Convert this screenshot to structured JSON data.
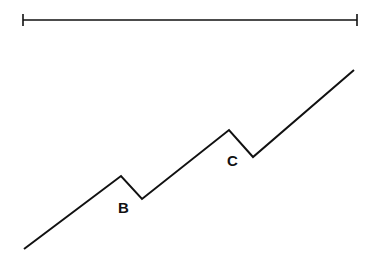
{
  "diagram": {
    "type": "zigzag-trend-line",
    "stroke_color": "#111111",
    "background": "#ffffff",
    "range_bar": {
      "x1": 23,
      "x2": 357,
      "y": 20,
      "cap_half_height": 6
    },
    "trend_points": [
      [
        24,
        249
      ],
      [
        121,
        176
      ],
      [
        142,
        199
      ],
      [
        229,
        130
      ],
      [
        253,
        157
      ],
      [
        354,
        70
      ]
    ],
    "labels": [
      {
        "text": "B",
        "x": 118,
        "y": 213
      },
      {
        "text": "C",
        "x": 227,
        "y": 166
      }
    ]
  }
}
